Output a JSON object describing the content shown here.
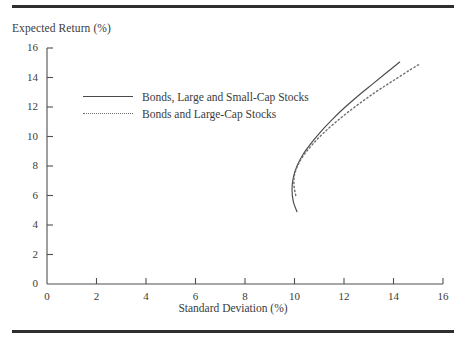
{
  "figure": {
    "rules": {
      "top": "top-rule",
      "bottom": "bottom-rule"
    }
  },
  "chart_data": {
    "type": "line",
    "title": "",
    "xlabel": "Standard Deviation (%)",
    "ylabel": "Expected Return (%)",
    "xlim": [
      0,
      16
    ],
    "ylim": [
      0,
      16
    ],
    "xticks": [
      0,
      2,
      4,
      6,
      8,
      10,
      12,
      14,
      16
    ],
    "yticks": [
      0,
      2,
      4,
      6,
      8,
      10,
      12,
      14,
      16
    ],
    "xtick_labels": [
      "0",
      "2",
      "4",
      "6",
      "8",
      "10",
      "12",
      "14",
      "16"
    ],
    "ytick_labels": [
      "0",
      "2",
      "4",
      "6",
      "8",
      "10",
      "12",
      "14",
      "16"
    ],
    "grid": false,
    "legend_position": "upper-left-inside",
    "series": [
      {
        "name": "Bonds, Large and Small-Cap Stocks",
        "style": "solid",
        "color": "#4a4a4a",
        "x": [
          10.1,
          9.95,
          9.9,
          9.95,
          10.1,
          10.35,
          10.7,
          11.1,
          11.55,
          12.05,
          12.6,
          13.15,
          13.7,
          14.25
        ],
        "y": [
          4.9,
          5.6,
          6.4,
          7.2,
          8.0,
          8.8,
          9.6,
          10.4,
          11.2,
          12.0,
          12.8,
          13.55,
          14.3,
          15.05
        ]
      },
      {
        "name": "Bonds and Large-Cap Stocks",
        "style": "dotted",
        "color": "#6e6e6e",
        "x": [
          10.05,
          9.98,
          10.0,
          10.15,
          10.4,
          10.75,
          11.15,
          11.65,
          12.2,
          12.8,
          13.4,
          14.05,
          14.7,
          15.05
        ],
        "y": [
          6.0,
          6.7,
          7.4,
          8.1,
          8.8,
          9.5,
          10.2,
          10.95,
          11.7,
          12.45,
          13.15,
          13.85,
          14.55,
          14.9
        ]
      }
    ]
  },
  "legend": {
    "items": [
      {
        "label": "Bonds, Large and Small-Cap Stocks",
        "style": "solid"
      },
      {
        "label": "Bonds and Large-Cap Stocks",
        "style": "dotted"
      }
    ]
  }
}
